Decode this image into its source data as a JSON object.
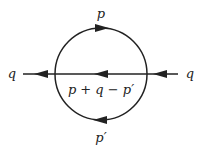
{
  "diagram": {
    "type": "feynman-diagram",
    "labels": {
      "top": "p",
      "bottom": "p′",
      "middle": "p + q − p′",
      "left": "q",
      "right": "q"
    },
    "arrows": {
      "top_propagator": "right",
      "bottom_propagator": "left",
      "middle_propagator": "left",
      "external_left": "left",
      "external_right": "left"
    },
    "line_color": "#222222"
  }
}
